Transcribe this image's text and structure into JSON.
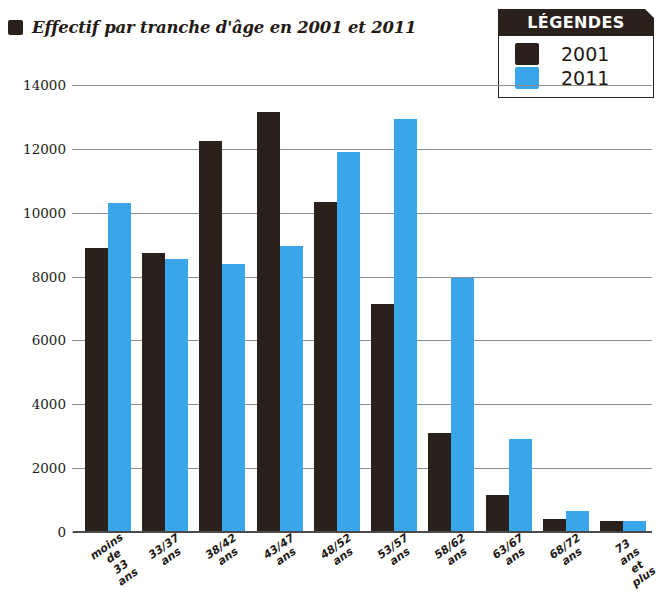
{
  "title": {
    "text": "Effectif par tranche d'âge en 2001 et 2011",
    "bullet_icon": "square-bullet-icon"
  },
  "legend": {
    "header": "LÉGENDES",
    "items": [
      {
        "label": "2001",
        "color": "#2b211c",
        "swatch_icon": "legend-swatch-2001"
      },
      {
        "label": "2011",
        "color": "#3aa5e8",
        "swatch_icon": "legend-swatch-2011"
      }
    ]
  },
  "chart_data": {
    "type": "bar",
    "title": "Effectif par tranche d'âge en 2001 et 2011",
    "xlabel": "",
    "ylabel": "",
    "ylim": [
      0,
      14000
    ],
    "yticks": [
      0,
      2000,
      4000,
      6000,
      8000,
      10000,
      12000,
      14000
    ],
    "ytick_labels": [
      "0",
      "2000",
      "4000",
      "6000",
      "8000",
      "10000",
      "12000",
      "14000"
    ],
    "grid": true,
    "legend_position": "top-right",
    "categories": [
      "moins de\n33 ans",
      "33/37\nans",
      "38/42\nans",
      "43/47\nans",
      "48/52\nans",
      "53/57\nans",
      "58/62\nans",
      "63/67\nans",
      "68/72\nans",
      "73 ans\net plus"
    ],
    "series": [
      {
        "name": "2001",
        "color": "#2b211c",
        "values": [
          8900,
          8750,
          12250,
          13150,
          10350,
          7150,
          3100,
          1150,
          400,
          350
        ]
      },
      {
        "name": "2011",
        "color": "#3aa5e8",
        "values": [
          10300,
          8550,
          8400,
          8950,
          11900,
          12950,
          7950,
          2900,
          650,
          330
        ]
      }
    ]
  }
}
